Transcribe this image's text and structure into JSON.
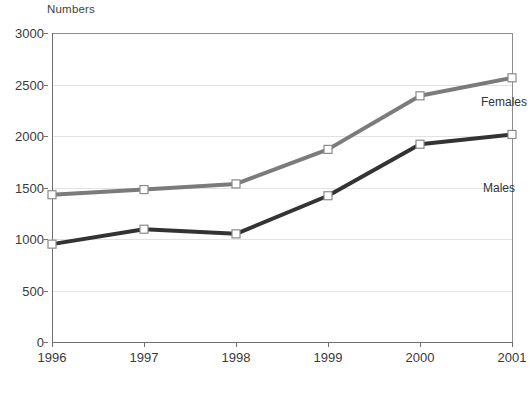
{
  "chart_data": {
    "type": "line",
    "title": "",
    "subtitle": "",
    "xlabel": "",
    "ylabel": "Numbers",
    "categories": [
      "1996",
      "1997",
      "1998",
      "1999",
      "2000",
      "2001"
    ],
    "x": [
      1996,
      1997,
      1998,
      1999,
      2000,
      2001
    ],
    "series": [
      {
        "name": "Females",
        "color": "#7b7b7b",
        "values": [
          1430,
          1480,
          1535,
          1870,
          2390,
          2565
        ],
        "marker": "open-square"
      },
      {
        "name": "Males",
        "color": "#333333",
        "values": [
          950,
          1095,
          1050,
          1420,
          1920,
          2015
        ],
        "marker": "open-square"
      }
    ],
    "ylim": [
      0,
      3000
    ],
    "yticks": [
      0,
      500,
      1000,
      1500,
      2000,
      2500,
      3000
    ],
    "ytick_labels": [
      "0",
      "500",
      "1000",
      "1500",
      "2000",
      "2500",
      "3000"
    ],
    "xtick_labels": [
      "1996",
      "1997",
      "1998",
      "1999",
      "2000",
      "2001"
    ],
    "grid": "horizontal",
    "legend": "inline-end-of-line",
    "annotations": [
      {
        "text": "Females",
        "near_x": 2001,
        "near_y": 2565
      },
      {
        "text": "Males",
        "near_x": 2001,
        "near_y": 2015
      }
    ]
  },
  "axis": {
    "y_title": "Numbers"
  },
  "caption": {
    "text": ""
  }
}
